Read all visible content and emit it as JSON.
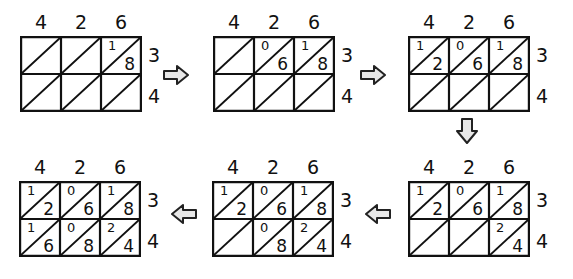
{
  "diagram": {
    "multiplicand_digits": [
      "4",
      "2",
      "6"
    ],
    "multiplier_digits": [
      "3",
      "4"
    ],
    "colors": {
      "line": "#111111",
      "arrow_fill": "#e8e8e8",
      "arrow_stroke": "#222222",
      "background": "#ffffff"
    },
    "steps": [
      {
        "step": 1,
        "cells": [
          [
            "",
            "",
            "1/8"
          ],
          [
            "",
            "",
            ""
          ]
        ]
      },
      {
        "step": 2,
        "cells": [
          [
            "",
            "0/6",
            "1/8"
          ],
          [
            "",
            "",
            ""
          ]
        ]
      },
      {
        "step": 3,
        "cells": [
          [
            "1/2",
            "0/6",
            "1/8"
          ],
          [
            "",
            "",
            ""
          ]
        ]
      },
      {
        "step": 4,
        "cells": [
          [
            "1/2",
            "0/6",
            "1/8"
          ],
          [
            "",
            "",
            "2/4"
          ]
        ]
      },
      {
        "step": 5,
        "cells": [
          [
            "1/2",
            "0/6",
            "1/8"
          ],
          [
            "",
            "0/8",
            "2/4"
          ]
        ]
      },
      {
        "step": 6,
        "cells": [
          [
            "1/2",
            "0/6",
            "1/8"
          ],
          [
            "1/6",
            "0/8",
            "2/4"
          ]
        ]
      }
    ],
    "panels": [
      {
        "top": [
          "4",
          "2",
          "6"
        ],
        "side": [
          "3",
          "4"
        ],
        "rows": [
          [
            {
              "t": "",
              "o": ""
            },
            {
              "t": "",
              "o": ""
            },
            {
              "t": "1",
              "o": "8"
            }
          ],
          [
            {
              "t": "",
              "o": ""
            },
            {
              "t": "",
              "o": ""
            },
            {
              "t": "",
              "o": ""
            }
          ]
        ]
      },
      {
        "top": [
          "4",
          "2",
          "6"
        ],
        "side": [
          "3",
          "4"
        ],
        "rows": [
          [
            {
              "t": "",
              "o": ""
            },
            {
              "t": "0",
              "o": "6"
            },
            {
              "t": "1",
              "o": "8"
            }
          ],
          [
            {
              "t": "",
              "o": ""
            },
            {
              "t": "",
              "o": ""
            },
            {
              "t": "",
              "o": ""
            }
          ]
        ]
      },
      {
        "top": [
          "4",
          "2",
          "6"
        ],
        "side": [
          "3",
          "4"
        ],
        "rows": [
          [
            {
              "t": "1",
              "o": "2"
            },
            {
              "t": "0",
              "o": "6"
            },
            {
              "t": "1",
              "o": "8"
            }
          ],
          [
            {
              "t": "",
              "o": ""
            },
            {
              "t": "",
              "o": ""
            },
            {
              "t": "",
              "o": ""
            }
          ]
        ]
      },
      {
        "top": [
          "4",
          "2",
          "6"
        ],
        "side": [
          "3",
          "4"
        ],
        "rows": [
          [
            {
              "t": "1",
              "o": "2"
            },
            {
              "t": "0",
              "o": "6"
            },
            {
              "t": "1",
              "o": "8"
            }
          ],
          [
            {
              "t": "",
              "o": ""
            },
            {
              "t": "",
              "o": ""
            },
            {
              "t": "2",
              "o": "4"
            }
          ]
        ]
      },
      {
        "top": [
          "4",
          "2",
          "6"
        ],
        "side": [
          "3",
          "4"
        ],
        "rows": [
          [
            {
              "t": "1",
              "o": "2"
            },
            {
              "t": "0",
              "o": "6"
            },
            {
              "t": "1",
              "o": "8"
            }
          ],
          [
            {
              "t": "",
              "o": ""
            },
            {
              "t": "0",
              "o": "8"
            },
            {
              "t": "2",
              "o": "4"
            }
          ]
        ]
      },
      {
        "top": [
          "4",
          "2",
          "6"
        ],
        "side": [
          "3",
          "4"
        ],
        "rows": [
          [
            {
              "t": "1",
              "o": "2"
            },
            {
              "t": "0",
              "o": "6"
            },
            {
              "t": "1",
              "o": "8"
            }
          ],
          [
            {
              "t": "1",
              "o": "6"
            },
            {
              "t": "0",
              "o": "8"
            },
            {
              "t": "2",
              "o": "4"
            }
          ]
        ]
      }
    ],
    "arrows": [
      {
        "from": 1,
        "to": 2,
        "direction": "right"
      },
      {
        "from": 2,
        "to": 3,
        "direction": "right"
      },
      {
        "from": 3,
        "to": 4,
        "direction": "down"
      },
      {
        "from": 4,
        "to": 5,
        "direction": "left"
      },
      {
        "from": 5,
        "to": 6,
        "direction": "left"
      }
    ]
  }
}
